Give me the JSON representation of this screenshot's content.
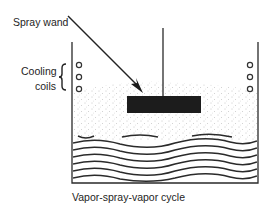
{
  "labels": {
    "spray_wand": "Spray wand",
    "cooling": "Cooling",
    "coils": "coils",
    "caption": "Vapor-spray-vapor cycle"
  },
  "diagram": {
    "type": "degreasing tank cross-section",
    "components": [
      "tank",
      "spray wand",
      "cooling coils (left)",
      "cooling coils (right)",
      "suspended part",
      "vapor zone",
      "boiling solvent"
    ],
    "colors": {
      "line": "#2a2a2a",
      "part": "#1c1c1c",
      "vapor_dots": "#8a8a8a",
      "background": "#ffffff"
    }
  }
}
